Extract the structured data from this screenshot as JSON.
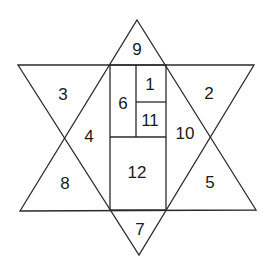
{
  "diagram": {
    "type": "star-of-david-partition",
    "regions": [
      {
        "id": "r1",
        "label": "1",
        "x": 150,
        "y": 84
      },
      {
        "id": "r2",
        "label": "2",
        "x": 209,
        "y": 93
      },
      {
        "id": "r3",
        "label": "3",
        "x": 63,
        "y": 94
      },
      {
        "id": "r4",
        "label": "4",
        "x": 89,
        "y": 136
      },
      {
        "id": "r5",
        "label": "5",
        "x": 210,
        "y": 182
      },
      {
        "id": "r6",
        "label": "6",
        "x": 123,
        "y": 103
      },
      {
        "id": "r7",
        "label": "7",
        "x": 140,
        "y": 229
      },
      {
        "id": "r8",
        "label": "8",
        "x": 65,
        "y": 183
      },
      {
        "id": "r9",
        "label": "9",
        "x": 137,
        "y": 49
      },
      {
        "id": "r10",
        "label": "10",
        "x": 185,
        "y": 133
      },
      {
        "id": "r11",
        "label": "11",
        "x": 150,
        "y": 120
      },
      {
        "id": "r12",
        "label": "12",
        "x": 137,
        "y": 172
      }
    ],
    "colors": {
      "line": "#2a2a2a",
      "text": "#1a1a1a",
      "background": "#ffffff"
    }
  }
}
